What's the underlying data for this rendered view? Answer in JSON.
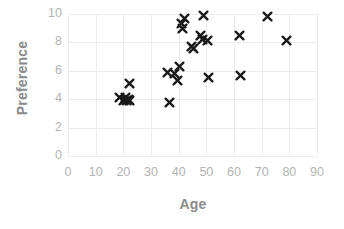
{
  "chart_data": {
    "type": "scatter",
    "title": "",
    "xlabel": "Age",
    "ylabel": "Preference",
    "xlim": [
      0,
      90
    ],
    "ylim": [
      0,
      10
    ],
    "xticks": [
      0,
      10,
      20,
      30,
      40,
      50,
      60,
      70,
      80,
      90
    ],
    "yticks": [
      0,
      2,
      4,
      6,
      8,
      10
    ],
    "grid": true,
    "legend": null,
    "marker": "x",
    "marker_color": "#1a1a1a",
    "axis_text_color": "#b3b3b3",
    "axis_title_color": "#8a8a8a",
    "grid_color": "#ededed",
    "series": [
      {
        "name": "Preference vs Age",
        "points": [
          {
            "x": 18.5,
            "y": 4.1
          },
          {
            "x": 20.0,
            "y": 3.9
          },
          {
            "x": 20.7,
            "y": 4.1
          },
          {
            "x": 21.3,
            "y": 3.9
          },
          {
            "x": 21.8,
            "y": 4.0
          },
          {
            "x": 22.2,
            "y": 5.1
          },
          {
            "x": 22.4,
            "y": 3.9
          },
          {
            "x": 35.8,
            "y": 5.9
          },
          {
            "x": 36.8,
            "y": 3.8
          },
          {
            "x": 38.6,
            "y": 5.8
          },
          {
            "x": 39.6,
            "y": 5.3
          },
          {
            "x": 40.2,
            "y": 6.3
          },
          {
            "x": 41.0,
            "y": 9.3
          },
          {
            "x": 41.4,
            "y": 9.0
          },
          {
            "x": 42.2,
            "y": 9.7
          },
          {
            "x": 44.6,
            "y": 7.7
          },
          {
            "x": 45.4,
            "y": 7.6
          },
          {
            "x": 47.8,
            "y": 8.5
          },
          {
            "x": 48.6,
            "y": 8.2
          },
          {
            "x": 49.0,
            "y": 9.9
          },
          {
            "x": 50.4,
            "y": 8.1
          },
          {
            "x": 50.8,
            "y": 5.5
          },
          {
            "x": 62.0,
            "y": 8.5
          },
          {
            "x": 62.2,
            "y": 5.7
          },
          {
            "x": 72.0,
            "y": 9.8
          },
          {
            "x": 79.0,
            "y": 8.1
          }
        ]
      }
    ]
  }
}
